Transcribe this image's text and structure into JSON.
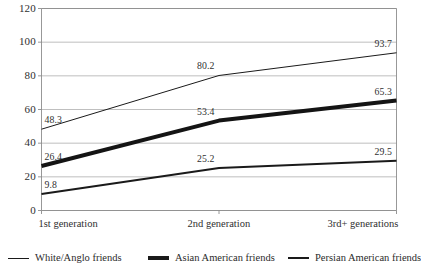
{
  "chart_data": {
    "type": "line",
    "title": "",
    "subtitle": "",
    "xlabel": "",
    "ylabel": "",
    "categories": [
      "1st generation",
      "2nd generation",
      "3rd+ generations"
    ],
    "ylim": [
      0,
      120
    ],
    "yticks": [
      0,
      20,
      40,
      60,
      80,
      100,
      120
    ],
    "grid": true,
    "legend_position": "bottom",
    "series": [
      {
        "name": "White/Anglo friends",
        "values": [
          48.3,
          80.2,
          93.7
        ],
        "labels": [
          "48.3",
          "80.2",
          "93.7"
        ],
        "color": "#1a1a1a",
        "width": 1,
        "swatch": "w1"
      },
      {
        "name": "Asian American friends",
        "values": [
          26.4,
          53.4,
          65.3
        ],
        "labels": [
          "26.4",
          "53.4",
          "65.3"
        ],
        "color": "#141414",
        "width": 4,
        "swatch": "w3"
      },
      {
        "name": "Persian American friends",
        "values": [
          9.8,
          25.2,
          29.5
        ],
        "labels": [
          "9.8",
          "25.2",
          "29.5"
        ],
        "color": "#1a1a1a",
        "width": 2,
        "swatch": "w2"
      }
    ]
  },
  "axis": {
    "ytick_labels": [
      "120",
      "100",
      "80",
      "60",
      "40",
      "20",
      "0"
    ],
    "xtick_labels": [
      "1st generation",
      "2nd generation",
      "3rd+ generations"
    ]
  },
  "legend": {
    "items": [
      {
        "label": "White/Anglo friends"
      },
      {
        "label": "Asian American friends"
      },
      {
        "label": "Persian American friends"
      }
    ]
  },
  "style": {
    "grid_color": "#b8b8b8",
    "axis_color": "#8c8c8c",
    "plot_background": "#ffffff",
    "text_color": "#2b2b2b"
  }
}
